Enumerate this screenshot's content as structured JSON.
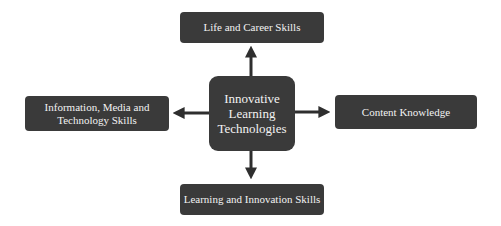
{
  "diagram": {
    "center": {
      "label": "Innovative Learning Technologies",
      "lines": [
        "Innovative",
        "Learning",
        "Technologies"
      ]
    },
    "nodes": {
      "top": {
        "label": "Life and Career Skills"
      },
      "left": {
        "label": "Information, Media and Technology Skills",
        "lines": [
          "Information, Media and",
          "Technology Skills"
        ]
      },
      "right": {
        "label": "Content Knowledge"
      },
      "bottom": {
        "label": "Learning and Innovation Skills"
      }
    },
    "edges": [
      {
        "from": "center",
        "to": "top"
      },
      {
        "from": "center",
        "to": "left"
      },
      {
        "from": "center",
        "to": "right"
      },
      {
        "from": "center",
        "to": "bottom"
      }
    ],
    "colors": {
      "box_fill": "#3a3a3a",
      "box_text": "#f2f2f2",
      "arrow": "#2e2e2e",
      "background": "#ffffff"
    }
  }
}
